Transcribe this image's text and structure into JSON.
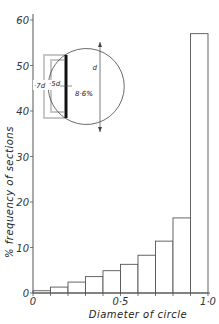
{
  "chart_data": {
    "type": "bar",
    "title": "",
    "xlabel": "Diameter of circle",
    "ylabel": "% frequency of sections",
    "ylim": [
      0,
      60
    ],
    "xlim": [
      0,
      1.0
    ],
    "grid": false,
    "legend": null,
    "x_ticks": [
      "0",
      "0·5",
      "1·0"
    ],
    "y_ticks": [
      "0",
      "10",
      "20",
      "30",
      "40",
      "50",
      "60"
    ],
    "categories": [
      "0–0.1",
      "0.1–0.2",
      "0.2–0.3",
      "0.3–0.4",
      "0.4–0.5",
      "0.5–0.6",
      "0.6–0.7",
      "0.7–0.8",
      "0.8–0.9",
      "0.9–1.0"
    ],
    "values": [
      0.5,
      1.3,
      2.4,
      3.6,
      4.9,
      6.3,
      8.3,
      11.4,
      16.5,
      57.0
    ],
    "annotations": {
      "inset_circle_label": "d",
      "inset_outer_chord": "·7d",
      "inset_inner_chord": "·5d",
      "inset_percent": "8·6%"
    }
  },
  "axis": {
    "x_ticks": [
      {
        "label": "0",
        "pos": 0
      },
      {
        "label": "0·5",
        "pos": 0.5
      },
      {
        "label": "1·0",
        "pos": 1.0
      }
    ],
    "y_ticks": [
      {
        "label": "0",
        "pos": 0
      },
      {
        "label": "10",
        "pos": 10
      },
      {
        "label": "20",
        "pos": 20
      },
      {
        "label": "30",
        "pos": 30
      },
      {
        "label": "40",
        "pos": 40
      },
      {
        "label": "50",
        "pos": 50
      },
      {
        "label": "60",
        "pos": 60
      }
    ],
    "x_title": "Diameter of circle",
    "y_title": "% frequency of sections"
  },
  "inset": {
    "d_label": "d",
    "outer_label": "·7d",
    "inner_label": "·5d",
    "percent_label": "8·6%"
  }
}
